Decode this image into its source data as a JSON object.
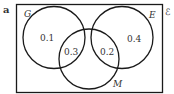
{
  "part_label": "a",
  "universal_set_symbol": "ℰ",
  "sets": {
    "G": {
      "label": "G"
    },
    "E": {
      "label": "E"
    },
    "M": {
      "label": "M"
    }
  },
  "regions": {
    "G_only": "0.1",
    "E_only": "0.4",
    "G_and_M": "0.3",
    "E_and_M": "0.2"
  },
  "colors": {
    "stroke": "#1a1a1a",
    "text": "#333333",
    "background": "#ffffff"
  }
}
